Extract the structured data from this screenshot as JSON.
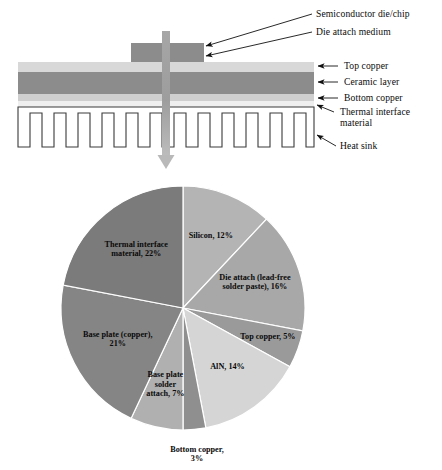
{
  "figure": {
    "schematic": {
      "title": "Semiconductor power module thermal stack",
      "callouts": [
        {
          "id": "die",
          "label": "Semiconductor die/chip"
        },
        {
          "id": "dam",
          "label": "Die attach medium"
        },
        {
          "id": "topcu",
          "label": "Top copper"
        },
        {
          "id": "cer",
          "label": "Ceramic layer"
        },
        {
          "id": "botcu",
          "label": "Bottom copper"
        },
        {
          "id": "tim",
          "label": "Thermal interface material"
        },
        {
          "id": "hs",
          "label": "Heat sink"
        }
      ],
      "colors": {
        "die": "#8c8c8c",
        "die_attach": "#8c8c8c",
        "top_copper": "#d8d8d8",
        "ceramic": "#8c8c8c",
        "bottom_copper": "#d0d0d0",
        "tim": "#ededed",
        "heat_sink_outline": "#3a3a3a",
        "heat_flow_arrow": "#9a9a9a",
        "leader_line": "#111111"
      }
    },
    "chart_data": {
      "type": "pie",
      "title": "",
      "units": "%",
      "start_angle_deg": 0,
      "direction": "clockwise",
      "legend": "none",
      "labels_inline": true,
      "categories": [
        "Silicon",
        "Die attach (lead-free solder paste)",
        "Top copper",
        "AlN",
        "Bottom copper",
        "Base plate solder attach",
        "Base plate (copper)",
        "Thermal interface material"
      ],
      "values": [
        12,
        16,
        5,
        14,
        3,
        7,
        21,
        22
      ],
      "slice_label_text": [
        "Silicon, 12%",
        "Die attach (lead-free|solder paste), 16%",
        "Top copper, 5%",
        "AlN, 14%",
        "Bottom copper,|3%",
        "Base plate|solder|attach, 7%",
        "Base plate (copper),|21%",
        "Thermal interface|material, 22%"
      ],
      "colors": [
        "#b4b4b4",
        "#a8a8a8",
        "#9a9a9a",
        "#d5d5d5",
        "#8f8f8f",
        "#b0b0b0",
        "#858585",
        "#7b7b7b"
      ]
    }
  }
}
